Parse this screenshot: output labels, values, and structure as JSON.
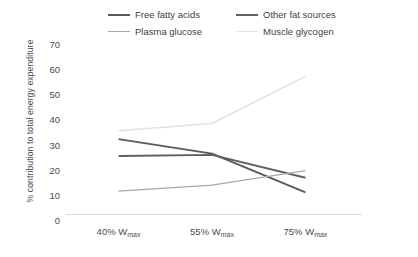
{
  "chart_data": {
    "type": "line",
    "title": "",
    "xlabel": "",
    "ylabel": "% contribution to total energy expenditure",
    "categories": [
      "40% Wmax",
      "55% Wmax",
      "75% Wmax"
    ],
    "category_labels": [
      {
        "value": "40%",
        "sub": "max",
        "unit": "W"
      },
      {
        "value": "55%",
        "sub": "max",
        "unit": "W"
      },
      {
        "value": "75%",
        "sub": "max",
        "unit": "W"
      }
    ],
    "ylim": [
      0,
      70
    ],
    "yticks": [
      0,
      10,
      20,
      30,
      40,
      50,
      60,
      70
    ],
    "grid": false,
    "legend_position": "top",
    "series": [
      {
        "name": "Free fatty acids",
        "values": [
          31,
          25,
          9
        ],
        "color": "#595959",
        "width": 1.9
      },
      {
        "name": "Other fat sources",
        "values": [
          24,
          24.5,
          15
        ],
        "color": "#5f5f5f",
        "width": 1.9
      },
      {
        "name": "Plasma glucose",
        "values": [
          9.5,
          12,
          18
        ],
        "color": "#a6a6a6",
        "width": 1.3
      },
      {
        "name": "Muscle glycogen",
        "values": [
          34.5,
          37.5,
          57
        ],
        "color": "#e2e2e2",
        "width": 1.5
      }
    ]
  },
  "legend": {
    "items": [
      {
        "label": "Free fatty acids",
        "color": "#595959"
      },
      {
        "label": "Other fat sources",
        "color": "#5f5f5f"
      },
      {
        "label": "Plasma glucose",
        "color": "#a6a6a6"
      },
      {
        "label": "Muscle glycogen",
        "color": "#e2e2e2"
      }
    ]
  },
  "axis": {
    "y_title": "% contribution to total energy expenditure",
    "y_tick_labels": [
      "70",
      "60",
      "50",
      "40",
      "30",
      "20",
      "10",
      "0"
    ],
    "x_tick_labels": [
      "40% W",
      "55% W",
      "75% W"
    ],
    "x_tick_subscript": "max"
  }
}
